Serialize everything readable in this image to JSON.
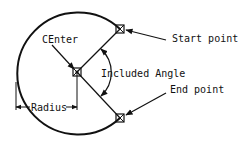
{
  "diagram": {
    "labels": {
      "center": "CEnter",
      "start_point": "Start point",
      "end_point": "End point",
      "included_angle": "Included Angle",
      "radius": "Radius"
    },
    "geometry": {
      "center": [
        77,
        72
      ],
      "radius": 61,
      "start_point": [
        120,
        29
      ],
      "end_point": [
        120,
        118
      ]
    },
    "colors": {
      "stroke": "#111111",
      "background": "#ffffff"
    }
  }
}
